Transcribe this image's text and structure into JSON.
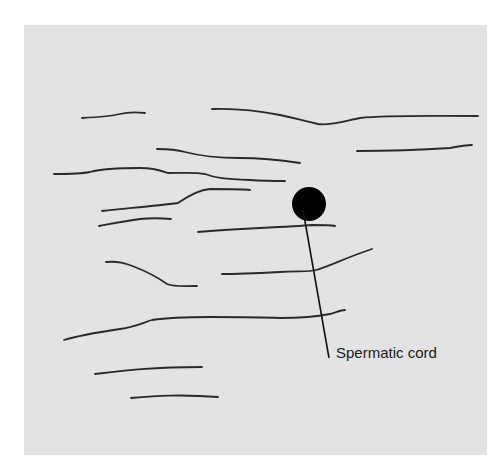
{
  "figure": {
    "panel_color": "#e3e3e3",
    "line_color": "#2a2a2a",
    "structure": {
      "name": "spermatic-cord-cross-section",
      "cx": 309,
      "cy": 204,
      "r": 17,
      "fill": "#000000"
    },
    "leader": {
      "x1": 303,
      "y1": 210,
      "x2": 329,
      "y2": 358
    },
    "label": "Spermatic cord",
    "fibers": [
      "M82,118 C100,117 112,116 120,114 C128,112 135,112 145,113",
      "M212,109 C240,108 265,112 280,115 C295,118 300,120 318,124 C330,126 345,121 360,118 C390,115 420,116 478,116",
      "M157,149 C170,149 178,150 185,152 C200,156 215,158 240,158 C260,158 280,160 300,163",
      "M357,151 C390,151 420,150 450,148 C460,146 465,145 472,145",
      "M54,174 C70,174 80,174 90,172 C105,168 125,168 140,168 C155,168 162,171 168,173 C185,173 195,172 205,174 C215,178 225,179 250,180 C265,181 275,181 285,181",
      "M102,211 C130,208 155,206 178,203 C188,196 198,190 210,189 C230,189 245,189 250,190",
      "M99,226 C110,224 125,221 140,219 C150,218 160,218 171,219",
      "M198,232 C220,230 240,229 260,228 C280,227 300,226 312,225 C320,225 330,225 335,226",
      "M106,262 C118,261 125,263 135,267 C150,273 160,279 167,284 C175,287 180,286 197,286",
      "M222,274 C240,274 260,273 280,272 C300,271 310,272 316,270 C330,266 345,258 372,249",
      "M64,340 C80,335 100,332 120,329 C135,327 145,322 152,320 C165,318 185,317 210,317 C240,317 260,317 280,318 C300,318 320,316 330,314 C335,313 340,310 345,310",
      "M95,374 C120,371 150,367 202,367",
      "M131,398 C155,396 180,394 218,397"
    ]
  }
}
